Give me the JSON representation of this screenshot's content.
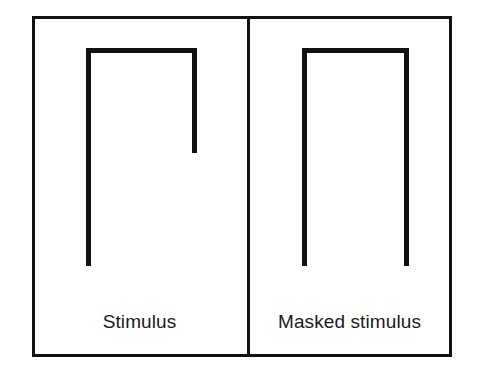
{
  "figure": {
    "background_color": "#ffffff",
    "stroke_color": "#111111",
    "frame": {
      "x": 32,
      "y": 16,
      "width": 420,
      "height": 341,
      "stroke_width": 3
    },
    "divider": {
      "x": 247,
      "y1": 16,
      "y2": 357,
      "stroke_width": 3
    },
    "panels": [
      {
        "id": "stimulus",
        "label": "Stimulus",
        "shape": {
          "description": "inverted-U with shortened right leg",
          "stroke_width": 5,
          "left_leg_x": 88,
          "right_leg_x": 194,
          "top_y": 50,
          "left_leg_bottom_y": 266,
          "right_leg_bottom_y": 153
        }
      },
      {
        "id": "masked-stimulus",
        "label": "Masked stimulus",
        "shape": {
          "description": "inverted-U with both legs full length",
          "stroke_width": 5,
          "left_leg_x": 304,
          "right_leg_x": 406,
          "top_y": 50,
          "left_leg_bottom_y": 266,
          "right_leg_bottom_y": 266
        }
      }
    ]
  }
}
